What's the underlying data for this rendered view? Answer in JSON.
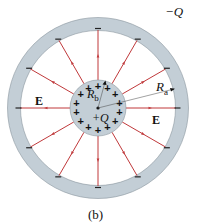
{
  "figure": {
    "caption": "(b)",
    "outer_shell": {
      "charge_label": "−Q",
      "radius_label": "R",
      "radius_sub": "a",
      "sign": "−",
      "sign_count": 12
    },
    "inner_sphere": {
      "charge_label": "+Q",
      "radius_label": "R",
      "radius_sub": "b",
      "sign": "+",
      "sign_count": 14
    },
    "field_label_left": "E",
    "field_label_right": "E",
    "field_line_count": 12
  },
  "colors": {
    "shell_fill": "#c3ced6",
    "shell_stroke": "#8a969e",
    "sphere_fill": "#c3ced6",
    "field_line": "#c0393b",
    "text": "#111111"
  }
}
